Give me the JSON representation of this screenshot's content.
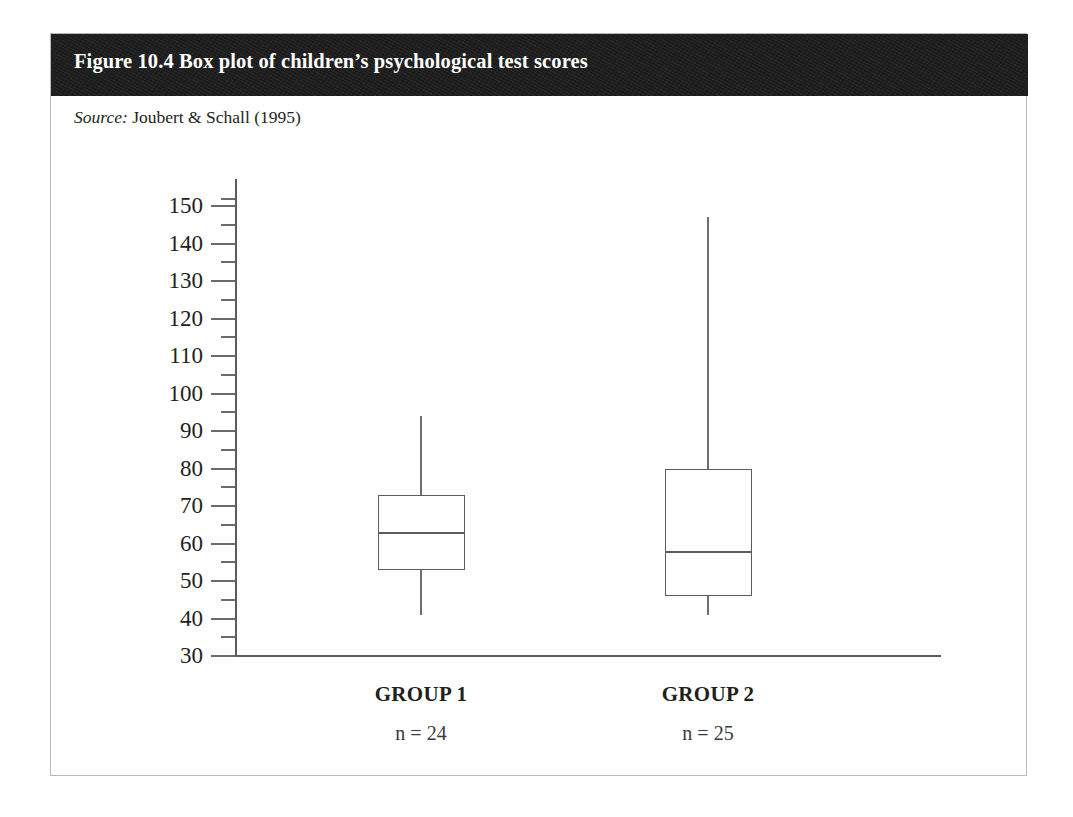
{
  "figure": {
    "title": "Figure 10.4 Box plot of children’s psychological test scores",
    "source_label": "Source:",
    "source_text": " Joubert & Schall (1995)"
  },
  "colors": {
    "header_background": "#1c1c1c",
    "header_text": "#ffffff",
    "frame_border": "#b9b9b9",
    "axis": "#5c5c5c",
    "box_outline": "#5c5c5c",
    "text": "#231f20",
    "plot_background": "#ffffff"
  },
  "chart_data": {
    "type": "box",
    "title": "Figure 10.4 Box plot of children’s psychological test scores",
    "subtitle": "Source: Joubert & Schall (1995)",
    "xlabel": "",
    "ylabel": "",
    "ylim": [
      30,
      152
    ],
    "y_major_step": 10,
    "y_minor_step": 5,
    "grid": false,
    "legend": "none",
    "y_ticks_major": [
      30,
      40,
      50,
      60,
      70,
      80,
      90,
      100,
      110,
      120,
      130,
      140,
      150
    ],
    "y_ticks_minor": [
      35,
      45,
      55,
      65,
      75,
      85,
      95,
      105,
      115,
      125,
      135,
      145,
      152
    ],
    "categories": [
      "GROUP 1",
      "GROUP 2"
    ],
    "sample_sizes": [
      24,
      25
    ],
    "boxes": [
      {
        "category": "GROUP 1",
        "n_label": "n = 24",
        "whisker_low": 41,
        "q1": 53,
        "median": 63,
        "q3": 73,
        "whisker_high": 94
      },
      {
        "category": "GROUP 2",
        "n_label": "n = 25",
        "whisker_low": 41,
        "q1": 46,
        "median": 58,
        "q3": 80,
        "whisker_high": 147
      }
    ]
  }
}
